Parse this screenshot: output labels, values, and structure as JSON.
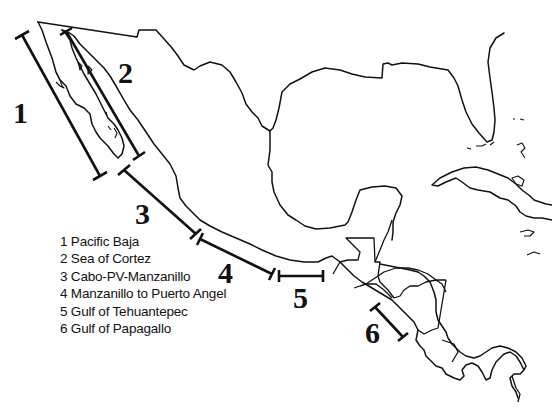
{
  "map": {
    "title": "",
    "region": "Mexico and Central America Pacific coast",
    "colors": {
      "background": "#ffffff",
      "ink": "#111111"
    },
    "segments": [
      {
        "id": "1",
        "label": "1",
        "name": "Pacific Baja",
        "x1": 22,
        "y1": 35,
        "x2": 100,
        "y2": 176,
        "label_x": 14,
        "label_y": 100
      },
      {
        "id": "2",
        "label": "2",
        "name": "Sea of Cortez",
        "x1": 66,
        "y1": 31,
        "x2": 139,
        "y2": 156,
        "label_x": 118,
        "label_y": 58
      },
      {
        "id": "3",
        "label": "3",
        "name": "Cabo-PV-Manzanillo",
        "x1": 124,
        "y1": 170,
        "x2": 196,
        "y2": 234,
        "label_x": 135,
        "label_y": 199
      },
      {
        "id": "4",
        "label": "4",
        "name": "Manzanillo to Puerto Angel",
        "x1": 200,
        "y1": 239,
        "x2": 272,
        "y2": 274,
        "label_x": 218,
        "label_y": 258
      },
      {
        "id": "5",
        "label": "5",
        "name": "Gulf of Tehuantepec",
        "x1": 279,
        "y1": 276,
        "x2": 323,
        "y2": 276,
        "label_x": 293,
        "label_y": 283
      },
      {
        "id": "6",
        "label": "6",
        "name": "Gulf of Papagallo",
        "x1": 375,
        "y1": 307,
        "x2": 403,
        "y2": 337,
        "label_x": 365,
        "label_y": 318
      }
    ]
  },
  "legend": {
    "items": [
      {
        "text": "1 Pacific Baja"
      },
      {
        "text": "2 Sea of Cortez"
      },
      {
        "text": "3 Cabo-PV-Manzanillo"
      },
      {
        "text": "4 Manzanillo to Puerto Angel"
      },
      {
        "text": "5 Gulf of Tehuantepec"
      },
      {
        "text": "6 Gulf of Papagallo"
      }
    ]
  }
}
